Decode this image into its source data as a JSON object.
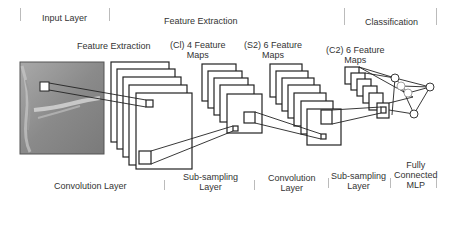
{
  "header": {
    "input_layer": "Input Layer",
    "feature_extraction": "Feature Extraction",
    "classification": "Classification"
  },
  "stages": {
    "feature_extraction": "Feature Extraction",
    "c1_line1": "(Cl) 4 Feature",
    "c1_line2": "Maps",
    "s2_line1": "(S2) 6 Feature",
    "s2_line2": "Maps",
    "c2_line1": "(C2) 6 Feature",
    "c2_line2": "Maps"
  },
  "footer": {
    "convolution_layer": "Convolution Layer",
    "subsampling_1_line1": "Sub-sampling",
    "subsampling_1_line2": "Layer",
    "convolution_2_line1": "Convolution",
    "convolution_2_line2": "Layer",
    "subsampling_2_line1": "Sub-sampling",
    "subsampling_2_line2": "Layer",
    "mlp_line1": "Fully",
    "mlp_line2": "Connected",
    "mlp_line3": "MLP"
  },
  "colors": {
    "stroke": "#222222",
    "separator": "#bbbbbb",
    "input_image": "#8a8a8a"
  }
}
